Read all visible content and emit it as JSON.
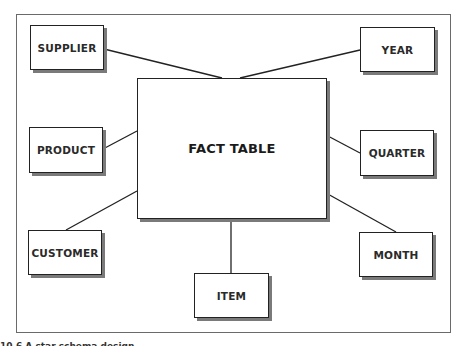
{
  "diagram": {
    "type": "star-schema",
    "center": {
      "label": "FACT TABLE"
    },
    "dimensions": [
      {
        "id": "supplier",
        "label": "SUPPLIER"
      },
      {
        "id": "year",
        "label": "YEAR"
      },
      {
        "id": "product",
        "label": "PRODUCT"
      },
      {
        "id": "quarter",
        "label": "QUARTER"
      },
      {
        "id": "customer",
        "label": "CUSTOMER"
      },
      {
        "id": "month",
        "label": "MONTH"
      },
      {
        "id": "item",
        "label": "ITEM"
      }
    ],
    "caption": "10.6  A star schema design."
  }
}
